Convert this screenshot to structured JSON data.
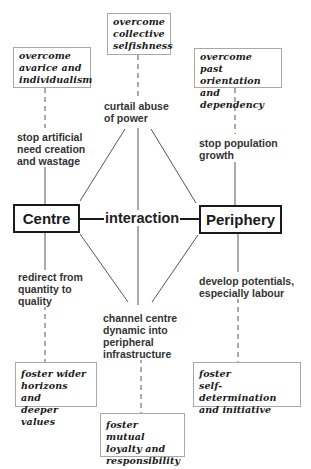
{
  "diagram": {
    "nodes": {
      "centre": "Centre",
      "periphery": "Periphery",
      "interaction": "interaction"
    },
    "top_boxes": {
      "left": "overcome\navarice and\nindividualism",
      "center": "overcome\ncollective\nselfishness",
      "right": "overcome past\norientation and\ndependency"
    },
    "bottom_boxes": {
      "left": "foster wider\nhorizons and\ndeeper values",
      "center": "foster mutual\nloyalty and\nresponsibility",
      "right": "foster\nself-determination\nand initiative"
    },
    "labels": {
      "top_left": "stop artificial\nneed creation\nand wastage",
      "top_center": "curtail abuse\nof power",
      "top_right": "stop population\ngrowth",
      "bottom_left": "redirect from\nquantity to\nquality",
      "bottom_center": "channel centre\ndynamic into\nperipheral\ninfrastructure",
      "bottom_right": "develop potentials,\nespecially labour"
    }
  }
}
